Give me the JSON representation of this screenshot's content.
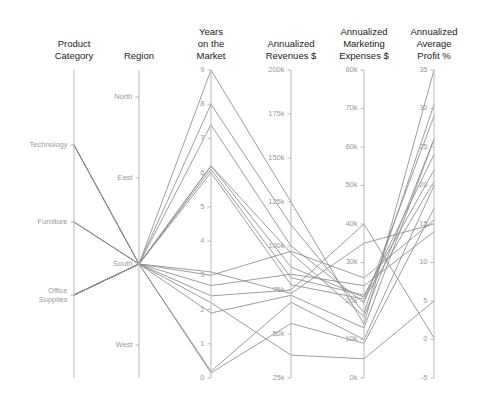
{
  "chart_data": {
    "type": "line",
    "subtype": "parallel-coordinates",
    "title": "",
    "grid": false,
    "legend": "none",
    "background_color": "#ffffff",
    "line_color": "#8c8c8c",
    "axis_color": "#b9b9b9",
    "tick_label_color": "#9a9a9a",
    "axis_title_color": "#1a1a1a",
    "axes": [
      {
        "key": "product_category",
        "title": "Product Category",
        "title_lines": [
          "Product",
          "Category"
        ],
        "scale": "categorical",
        "categories": [
          "Technology",
          "Furniture",
          "Office Supplies"
        ],
        "tick_labels": [
          "Technology",
          "Furniture",
          "Office Supplies"
        ]
      },
      {
        "key": "region",
        "title": "Region",
        "title_lines": [
          "Region"
        ],
        "scale": "categorical",
        "categories": [
          "North",
          "East",
          "South",
          "West"
        ],
        "tick_labels": [
          "North",
          "East",
          "South",
          "West"
        ]
      },
      {
        "key": "years_on_market",
        "title": "Years on the Market",
        "title_lines": [
          "Years",
          "on the",
          "Market"
        ],
        "scale": "linear",
        "range": [
          0,
          9
        ],
        "tick_values": [
          0,
          1,
          2,
          3,
          4,
          5,
          6,
          7,
          8,
          9
        ],
        "tick_labels": [
          "0",
          "1",
          "2",
          "3",
          "4",
          "5",
          "6",
          "7",
          "8",
          "9"
        ]
      },
      {
        "key": "annualized_revenues",
        "title": "Annualized Revenues $",
        "title_lines": [
          "Annualized",
          "Revenues $"
        ],
        "scale": "linear",
        "range": [
          25000,
          200000
        ],
        "tick_values": [
          25000,
          50000,
          75000,
          100000,
          125000,
          150000,
          175000,
          200000
        ],
        "tick_labels": [
          "25k",
          "50k",
          "75k",
          "100k",
          "125k",
          "150k",
          "175k",
          "200k"
        ]
      },
      {
        "key": "annualized_marketing_expenses",
        "title": "Annualized Marketing Expenses $",
        "title_lines": [
          "Annualized",
          "Marketing",
          "Expenses $"
        ],
        "scale": "linear",
        "range": [
          0,
          80000
        ],
        "tick_values": [
          0,
          10000,
          20000,
          30000,
          40000,
          50000,
          60000,
          70000,
          80000
        ],
        "tick_labels": [
          "0k",
          "10k",
          "20k",
          "30k",
          "40k",
          "50k",
          "60k",
          "70k",
          "80k"
        ]
      },
      {
        "key": "annualized_average_profit",
        "title": "Annualized Average Profit %",
        "title_lines": [
          "Annualized",
          "Average",
          "Profit %"
        ],
        "scale": "linear",
        "range": [
          -5,
          35
        ],
        "tick_values": [
          -5,
          0,
          5,
          10,
          15,
          20,
          25,
          30,
          35
        ],
        "tick_labels": [
          "-5",
          "0",
          "5",
          "10",
          "15",
          "20",
          "25",
          "30",
          "35"
        ]
      }
    ],
    "series": [
      {
        "name": "row-1",
        "values": {
          "product_category": "Technology",
          "region": "South",
          "years_on_market": 9,
          "annualized_revenues": 125000,
          "annualized_marketing_expenses": 14000,
          "annualized_average_profit": 35
        }
      },
      {
        "name": "row-2",
        "values": {
          "product_category": "Technology",
          "region": "South",
          "years_on_market": 8,
          "annualized_revenues": 112000,
          "annualized_marketing_expenses": 17000,
          "annualized_average_profit": 30.5
        }
      },
      {
        "name": "row-3",
        "values": {
          "product_category": "Technology",
          "region": "South",
          "years_on_market": 7.4,
          "annualized_revenues": 100000,
          "annualized_marketing_expenses": 19500,
          "annualized_average_profit": 29
        }
      },
      {
        "name": "row-4",
        "values": {
          "product_category": "Technology",
          "region": "South",
          "years_on_market": 6.2,
          "annualized_revenues": 96000,
          "annualized_marketing_expenses": 16000,
          "annualized_average_profit": 26
        }
      },
      {
        "name": "row-5",
        "values": {
          "product_category": "Furniture",
          "region": "South",
          "years_on_market": 6.2,
          "annualized_revenues": 88000,
          "annualized_marketing_expenses": 21000,
          "annualized_average_profit": 24
        }
      },
      {
        "name": "row-6",
        "values": {
          "product_category": "Furniture",
          "region": "South",
          "years_on_market": 6.1,
          "annualized_revenues": 82000,
          "annualized_marketing_expenses": 21500,
          "annualized_average_profit": 22
        }
      },
      {
        "name": "row-7",
        "values": {
          "product_category": "Furniture",
          "region": "South",
          "years_on_market": 6.0,
          "annualized_revenues": 78000,
          "annualized_marketing_expenses": 20500,
          "annualized_average_profit": 20.5
        }
      },
      {
        "name": "row-8",
        "values": {
          "product_category": "Office Supplies",
          "region": "South",
          "years_on_market": 3,
          "annualized_revenues": 97000,
          "annualized_marketing_expenses": 26000,
          "annualized_average_profit": 15.5
        }
      },
      {
        "name": "row-9",
        "values": {
          "product_category": "Office Supplies",
          "region": "South",
          "years_on_market": 2.7,
          "annualized_revenues": 84000,
          "annualized_marketing_expenses": 24000,
          "annualized_average_profit": 14
        }
      },
      {
        "name": "row-10",
        "values": {
          "product_category": "Office Supplies",
          "region": "South",
          "years_on_market": 2.4,
          "annualized_revenues": 75000,
          "annualized_marketing_expenses": 40000,
          "annualized_average_profit": 0.2
        }
      },
      {
        "name": "row-11",
        "values": {
          "product_category": "Office Supplies",
          "region": "South",
          "years_on_market": 1.9,
          "annualized_revenues": 72000,
          "annualized_marketing_expenses": 13000,
          "annualized_average_profit": 26
        }
      },
      {
        "name": "row-12",
        "values": {
          "product_category": "Office Supplies",
          "region": "South",
          "years_on_market": 0.2,
          "annualized_revenues": 68000,
          "annualized_marketing_expenses": 10000,
          "annualized_average_profit": 20
        }
      },
      {
        "name": "row-13",
        "values": {
          "product_category": "Office Supplies",
          "region": "South",
          "years_on_market": 0.15,
          "annualized_revenues": 56000,
          "annualized_marketing_expenses": 9000,
          "annualized_average_profit": 17
        }
      },
      {
        "name": "row-14",
        "values": {
          "product_category": "Office Supplies",
          "region": "South",
          "years_on_market": 2.2,
          "annualized_revenues": 38000,
          "annualized_marketing_expenses": 5000,
          "annualized_average_profit": 5
        }
      },
      {
        "name": "row-15",
        "values": {
          "product_category": "Office Supplies",
          "region": "South",
          "years_on_market": 3.1,
          "annualized_revenues": 73000,
          "annualized_marketing_expenses": 35000,
          "annualized_average_profit": 15
        }
      }
    ]
  },
  "layout": {
    "axis_x_positions": [
      197,
      263,
      313,
      371,
      430,
      487
    ],
    "plot_top": 70,
    "plot_bottom": 378
  }
}
